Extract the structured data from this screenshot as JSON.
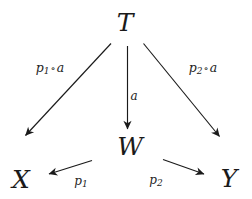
{
  "diagram": {
    "kind": "commutative-diagram",
    "background_color": "#ffffff",
    "ink_color": "#1a1a1a",
    "nodes": [
      {
        "id": "T",
        "label": "T",
        "x": 125,
        "y": 22
      },
      {
        "id": "W",
        "label": "W",
        "x": 130,
        "y": 146
      },
      {
        "id": "X",
        "label": "X",
        "x": 21,
        "y": 179
      },
      {
        "id": "Y",
        "label": "Y",
        "x": 229,
        "y": 178
      }
    ],
    "edges": [
      {
        "id": "T-to-X",
        "from": "T",
        "to": "X",
        "label_base": "p",
        "label_sub": "1",
        "label_circ": "∘",
        "label_arg": "a",
        "label_x": 50,
        "label_y": 69
      },
      {
        "id": "T-to-W",
        "from": "T",
        "to": "W",
        "label_base": "a",
        "label_sub": "",
        "label_circ": "",
        "label_arg": "",
        "label_x": 134,
        "label_y": 96
      },
      {
        "id": "T-to-Y",
        "from": "T",
        "to": "Y",
        "label_base": "p",
        "label_sub": "2",
        "label_circ": "∘",
        "label_arg": "a",
        "label_x": 203,
        "label_y": 69
      },
      {
        "id": "W-to-X",
        "from": "W",
        "to": "X",
        "label_base": "p",
        "label_sub": "1",
        "label_circ": "",
        "label_arg": "",
        "label_x": 81,
        "label_y": 182
      },
      {
        "id": "W-to-Y",
        "from": "W",
        "to": "Y",
        "label_base": "p",
        "label_sub": "2",
        "label_circ": "",
        "label_arg": "",
        "label_x": 156,
        "label_y": 181
      }
    ]
  }
}
